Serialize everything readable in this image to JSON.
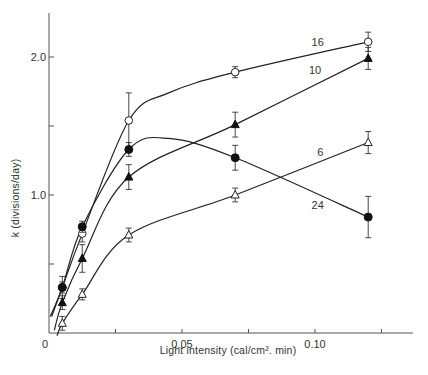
{
  "chart_data": {
    "type": "line",
    "title": "",
    "xlabel": "Light intensity (cal/cm². min)",
    "ylabel": "k (divisions/day)",
    "xlim": [
      0,
      0.14
    ],
    "ylim": [
      0,
      2.3
    ],
    "x_ticks": [
      0,
      0.025,
      0.05,
      0.075,
      0.1,
      0.125
    ],
    "x_tick_labels": [
      "0",
      "",
      "0.05",
      "",
      "0.10",
      ""
    ],
    "y_ticks": [
      0.5,
      1.0,
      1.5,
      2.0
    ],
    "y_tick_labels": [
      "",
      "1.0",
      "",
      "2.0"
    ],
    "grid": false,
    "legend": "inline labels at line ends",
    "x": [
      0.005,
      0.0125,
      0.03,
      0.07,
      0.12
    ],
    "series": [
      {
        "name": "16",
        "marker": "open-circle",
        "values": [
          0.33,
          0.72,
          1.54,
          1.89,
          2.11
        ],
        "errors": [
          0.08,
          0.06,
          0.2,
          0.04,
          0.07
        ],
        "label_pos": [
          0.101,
          2.08
        ]
      },
      {
        "name": "10",
        "marker": "filled-triangle",
        "values": [
          0.22,
          0.54,
          1.13,
          1.51,
          1.99
        ],
        "errors": [
          0.05,
          0.1,
          0.09,
          0.09,
          0.08
        ],
        "label_pos": [
          0.1,
          1.88
        ]
      },
      {
        "name": "24",
        "marker": "filled-circle",
        "values": [
          0.33,
          0.77,
          1.33,
          1.27,
          0.84
        ],
        "errors": [
          0.04,
          0.04,
          0.05,
          0.09,
          0.15
        ],
        "label_pos": [
          0.101,
          0.9
        ]
      },
      {
        "name": "6",
        "marker": "open-triangle",
        "values": [
          0.07,
          0.28,
          0.71,
          1.0,
          1.38
        ],
        "errors": [
          0.05,
          0.04,
          0.05,
          0.05,
          0.08
        ],
        "label_pos": [
          0.102,
          1.28
        ]
      }
    ]
  }
}
